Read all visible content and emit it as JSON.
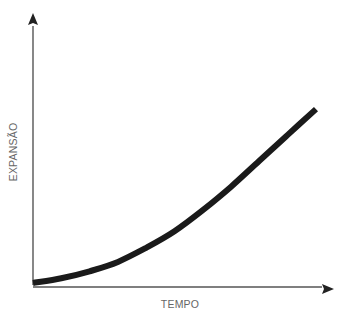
{
  "chart_data": {
    "type": "line",
    "title": "",
    "xlabel": "TEMPO",
    "ylabel": "EXPANSÃO",
    "grid": false,
    "legend": null,
    "ticks": {
      "x": [],
      "y": []
    },
    "series": [
      {
        "name": "expansão",
        "color": "#1a1a1a",
        "x": [
          0,
          0.1,
          0.2,
          0.3,
          0.4,
          0.5,
          0.6,
          0.7,
          0.8,
          0.9,
          1.0
        ],
        "y": [
          0.0,
          0.02,
          0.05,
          0.09,
          0.15,
          0.22,
          0.31,
          0.41,
          0.52,
          0.63,
          0.74
        ]
      }
    ],
    "xlim": [
      0,
      1
    ],
    "ylim": [
      0,
      1
    ]
  },
  "colors": {
    "axis": "#555555",
    "arrowhead": "#222222",
    "curve": "#1a1a1a",
    "label": "#666666",
    "background": "#ffffff"
  }
}
